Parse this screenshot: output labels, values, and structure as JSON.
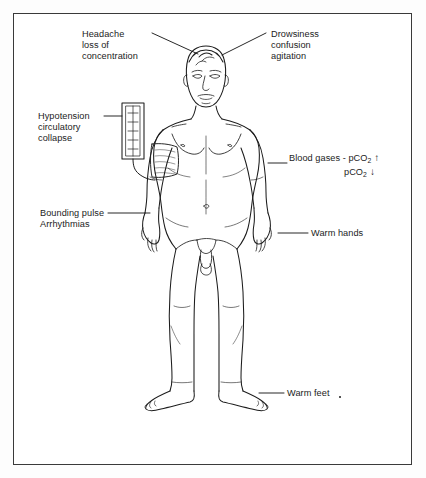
{
  "diagram": {
    "border_color": "#3a3a3a",
    "line_color": "#1c1c1c",
    "background_color": "#ffffff"
  },
  "labels": {
    "headache": {
      "name": "headache-label",
      "lines": [
        "Headache",
        "loss of",
        "concentration"
      ],
      "leader_to": "head-top-left"
    },
    "drowsiness": {
      "name": "drowsiness-label",
      "lines": [
        "Drowsiness",
        "confusion",
        "agitation"
      ],
      "leader_to": "head-top-right"
    },
    "hypotension": {
      "name": "hypotension-label",
      "lines": [
        "Hypotension",
        "circulatory",
        "collapse"
      ],
      "leader_to": "sphygmomanometer"
    },
    "bounding_pulse": {
      "name": "bounding-pulse-label",
      "lines": [
        "Bounding pulse",
        "Arrhythmias"
      ],
      "leader_to": "left-wrist"
    },
    "blood_gases": {
      "name": "blood-gases-label",
      "prefix": "Blood gases - ",
      "rows": [
        {
          "analyte": "pCO",
          "subscript": "2",
          "arrow": "↑"
        },
        {
          "analyte": "pCO",
          "subscript": "2",
          "arrow": "↓"
        }
      ],
      "leader_to": "right-forearm"
    },
    "warm_hands": {
      "name": "warm-hands-label",
      "text": "Warm hands",
      "leader_to": "right-hand"
    },
    "warm_feet": {
      "name": "warm-feet-label",
      "text": "Warm feet",
      "leader_to": "right-foot"
    }
  },
  "equipment": {
    "sphygmomanometer": {
      "name": "sphygmomanometer",
      "parts": [
        "manometer-column",
        "rubber-tubing",
        "arm-cuff"
      ],
      "tick_count": 5
    }
  }
}
